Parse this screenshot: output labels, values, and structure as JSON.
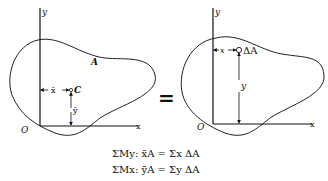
{
  "left_figure": {
    "y_axis_label": "y",
    "x_axis_label": "x",
    "origin_label": "O",
    "area_label": "A",
    "centroid_label": "C",
    "x_dim_label": "x̄",
    "y_dim_label": "ȳ"
  },
  "equals_sign": "=",
  "right_figure": {
    "y_axis_label": "y",
    "x_axis_label": "x",
    "origin_label": "O",
    "element_label": "ΔA",
    "x_dim_label": "x",
    "y_dim_label": "y"
  },
  "equations": {
    "line1": "ΣMy:  x̄A = Σx ΔA",
    "line2": "ΣMx:  ȳA = Σy ΔA"
  }
}
